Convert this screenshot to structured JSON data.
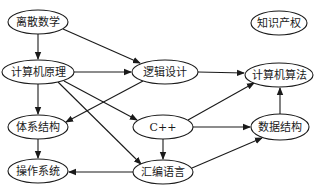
{
  "diagram": {
    "type": "directed-graph",
    "nodes": [
      {
        "id": "lisan",
        "label": "离散数学",
        "cx": 38,
        "cy": 22,
        "rx": 30,
        "ry": 12
      },
      {
        "id": "yuanli",
        "label": "计算机原理",
        "cx": 38,
        "cy": 72,
        "rx": 36,
        "ry": 12
      },
      {
        "id": "luoji",
        "label": "逻辑设计",
        "cx": 165,
        "cy": 72,
        "rx": 33,
        "ry": 12
      },
      {
        "id": "tixi",
        "label": "体系结构",
        "cx": 38,
        "cy": 127,
        "rx": 30,
        "ry": 12
      },
      {
        "id": "cpp",
        "label": "C++",
        "cx": 163,
        "cy": 127,
        "rx": 30,
        "ry": 12
      },
      {
        "id": "caozuo",
        "label": "操作系统",
        "cx": 38,
        "cy": 171,
        "rx": 30,
        "ry": 12
      },
      {
        "id": "huibian",
        "label": "汇编语言",
        "cx": 163,
        "cy": 172,
        "rx": 30,
        "ry": 12
      },
      {
        "id": "zhishi",
        "label": "知识产权",
        "cx": 279,
        "cy": 23,
        "rx": 28,
        "ry": 12
      },
      {
        "id": "suanfa",
        "label": "计算机算法",
        "cx": 279,
        "cy": 75,
        "rx": 34,
        "ry": 12
      },
      {
        "id": "shuju",
        "label": "数据结构",
        "cx": 280,
        "cy": 127,
        "rx": 29,
        "ry": 13
      }
    ],
    "edges": [
      {
        "from": "lisan",
        "to": "yuanli",
        "x1": 38,
        "y1": 34,
        "x2": 38,
        "y2": 59
      },
      {
        "from": "lisan",
        "to": "luoji",
        "x1": 63,
        "y1": 29,
        "x2": 140,
        "y2": 63
      },
      {
        "from": "yuanli",
        "to": "luoji",
        "x1": 74,
        "y1": 72,
        "x2": 131,
        "y2": 72
      },
      {
        "from": "yuanli",
        "to": "tixi",
        "x1": 38,
        "y1": 84,
        "x2": 38,
        "y2": 114
      },
      {
        "from": "yuanli",
        "to": "cpp",
        "x1": 64,
        "y1": 81,
        "x2": 137,
        "y2": 120
      },
      {
        "from": "yuanli",
        "to": "huibian",
        "x1": 58,
        "y1": 82,
        "x2": 141,
        "y2": 164
      },
      {
        "from": "luoji",
        "to": "tixi",
        "x1": 143,
        "y1": 81,
        "x2": 66,
        "y2": 122
      },
      {
        "from": "luoji",
        "to": "suanfa",
        "x1": 198,
        "y1": 72,
        "x2": 244,
        "y2": 73
      },
      {
        "from": "tixi",
        "to": "caozuo",
        "x1": 38,
        "y1": 139,
        "x2": 38,
        "y2": 158
      },
      {
        "from": "cpp",
        "to": "suanfa",
        "x1": 188,
        "y1": 120,
        "x2": 254,
        "y2": 83
      },
      {
        "from": "cpp",
        "to": "shuju",
        "x1": 193,
        "y1": 127,
        "x2": 250,
        "y2": 127
      },
      {
        "from": "cpp",
        "to": "huibian",
        "x1": 163,
        "y1": 139,
        "x2": 163,
        "y2": 159
      },
      {
        "from": "huibian",
        "to": "caozuo",
        "x1": 133,
        "y1": 172,
        "x2": 69,
        "y2": 172
      },
      {
        "from": "huibian",
        "to": "shuju",
        "x1": 192,
        "y1": 168,
        "x2": 262,
        "y2": 138
      },
      {
        "from": "shuju",
        "to": "suanfa",
        "x1": 280,
        "y1": 114,
        "x2": 280,
        "y2": 88
      }
    ],
    "colors": {
      "stroke": "#1a1a1a",
      "fill": "#ffffff"
    }
  }
}
